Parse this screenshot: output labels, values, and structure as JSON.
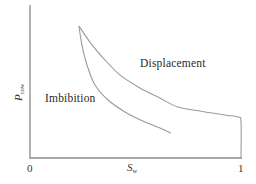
{
  "chart_data": {
    "type": "line",
    "title": "",
    "xlabel": "S_w",
    "ylabel": "P_cow",
    "xlim": [
      0,
      1
    ],
    "ylim": [
      0,
      1
    ],
    "grid": false,
    "legend": null,
    "x_ticks": [
      "0",
      "1"
    ],
    "y_ticks": [],
    "annotations": [
      {
        "text": "Displacement",
        "x": 0.52,
        "y": 0.62
      },
      {
        "text": "Imbibition",
        "x": 0.07,
        "y": 0.38
      }
    ],
    "series": [
      {
        "name": "Displacement",
        "x": [
          0.232,
          0.294,
          0.355,
          0.427,
          0.521,
          0.616,
          0.701,
          0.806,
          0.924,
          0.986,
          1.0,
          1.0
        ],
        "y": [
          0.863,
          0.739,
          0.641,
          0.542,
          0.458,
          0.392,
          0.333,
          0.307,
          0.281,
          0.268,
          0.235,
          0.0
        ]
      },
      {
        "name": "Imbibition",
        "x": [
          0.232,
          0.246,
          0.27,
          0.308,
          0.37,
          0.45,
          0.545,
          0.616,
          0.668
        ],
        "y": [
          0.863,
          0.739,
          0.608,
          0.477,
          0.379,
          0.301,
          0.235,
          0.196,
          0.163
        ]
      }
    ]
  },
  "labels": {
    "x_tick_0": "0",
    "x_tick_1": "1",
    "x_title_main": "S",
    "x_title_sub": "w",
    "y_title_main": "P",
    "y_title_sub": "cow",
    "displacement": "Displacement",
    "imbibition": "Imbibition"
  },
  "colors": {
    "axis": "#8a8a8a",
    "curve": "#9a9a9a",
    "text": "#333333"
  }
}
